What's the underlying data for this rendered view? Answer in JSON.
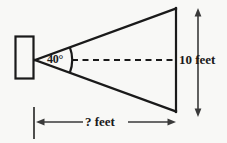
{
  "figure": {
    "background_color": "#f8f8f6",
    "stroke_color": "#1a1a1a",
    "labels": {
      "angle": "40°",
      "height": "10 feet",
      "distance": "? feet"
    },
    "shapes": {
      "source_rectangle": {
        "name": "projector-box",
        "x": 15,
        "y": 36,
        "width": 19,
        "height": 43
      },
      "apex": {
        "x": 35,
        "y": 60
      },
      "screen_line": {
        "x": 176,
        "y_top": 8,
        "y_bottom": 112
      },
      "center_dashed_line": {
        "x1": 72,
        "y1": 60,
        "x2": 176,
        "y2": 60
      },
      "angle_arc": {
        "cx": 35,
        "cy": 60,
        "radius": 36
      },
      "vertical_dimension_arrow": {
        "x": 198,
        "y_top": 10,
        "y_bottom": 115
      },
      "horizontal_dimension_arrow": {
        "y": 122,
        "x_left": 36,
        "x_right": 176
      },
      "left_extension_tick": {
        "x": 34,
        "y_top": 107,
        "y_bottom": 139
      }
    }
  }
}
